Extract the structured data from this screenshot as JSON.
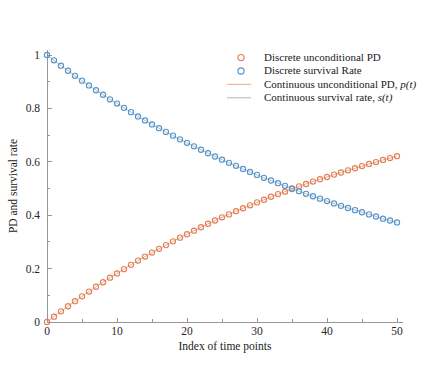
{
  "chart_data": {
    "type": "scatter",
    "title": "",
    "xlabel": "Index of time points",
    "ylabel": "PD and survival rate",
    "xlim": [
      0,
      50
    ],
    "ylim": [
      0,
      1
    ],
    "xticks": [
      0,
      10,
      20,
      30,
      40,
      50
    ],
    "xtick_labels": [
      "0",
      "10",
      "20",
      "30",
      "40",
      "50"
    ],
    "yticks": [
      0,
      0.2,
      0.4,
      0.6,
      0.8,
      1
    ],
    "ytick_labels": [
      "0",
      "0.2",
      "0.4",
      "0.6",
      "0.8",
      "1"
    ],
    "xminor_step": 5,
    "yminor_step": 0.1,
    "grid": false,
    "legend_position": "top-right",
    "marker": "open-circle",
    "colors": {
      "pd": "#E2815A",
      "survival": "#5596CE",
      "continuous_pd": "#E8A17F",
      "continuous_survival": "#6E7680",
      "axis": "#8C8C8C",
      "text": "#1A1A1A",
      "background": "#FFFFFF"
    },
    "x": [
      0,
      1,
      2,
      3,
      4,
      5,
      6,
      7,
      8,
      9,
      10,
      11,
      12,
      13,
      14,
      15,
      16,
      17,
      18,
      19,
      20,
      21,
      22,
      23,
      24,
      25,
      26,
      27,
      28,
      29,
      30,
      31,
      32,
      33,
      34,
      35,
      36,
      37,
      38,
      39,
      40,
      41,
      42,
      43,
      44,
      45,
      46,
      47,
      48,
      49,
      50
    ],
    "series": [
      {
        "name": "Discrete unconditional PD",
        "key": "pd",
        "style": "open-circle-marker",
        "color": "#E2815A",
        "values": [
          0.0,
          0.02,
          0.04,
          0.059,
          0.078,
          0.096,
          0.114,
          0.132,
          0.149,
          0.166,
          0.182,
          0.198,
          0.214,
          0.23,
          0.245,
          0.26,
          0.274,
          0.288,
          0.302,
          0.316,
          0.329,
          0.342,
          0.355,
          0.368,
          0.38,
          0.392,
          0.403,
          0.415,
          0.426,
          0.437,
          0.448,
          0.458,
          0.469,
          0.479,
          0.488,
          0.498,
          0.508,
          0.517,
          0.526,
          0.535,
          0.543,
          0.552,
          0.56,
          0.568,
          0.576,
          0.584,
          0.592,
          0.599,
          0.607,
          0.614,
          0.621
        ]
      },
      {
        "name": "Discrete survival Rate",
        "key": "survival",
        "style": "open-circle-marker",
        "color": "#5596CE",
        "values": [
          1.0,
          0.98,
          0.96,
          0.941,
          0.922,
          0.904,
          0.886,
          0.868,
          0.851,
          0.834,
          0.818,
          0.802,
          0.786,
          0.77,
          0.755,
          0.74,
          0.726,
          0.712,
          0.698,
          0.684,
          0.671,
          0.658,
          0.645,
          0.632,
          0.62,
          0.608,
          0.596,
          0.585,
          0.573,
          0.562,
          0.551,
          0.54,
          0.53,
          0.52,
          0.51,
          0.5,
          0.49,
          0.48,
          0.471,
          0.462,
          0.453,
          0.444,
          0.435,
          0.427,
          0.419,
          0.411,
          0.403,
          0.395,
          0.387,
          0.38,
          0.373
        ]
      },
      {
        "name": "Continuous unconditional PD, p(t)",
        "key": "continuous_pd",
        "style": "line",
        "color": "#E8A17F"
      },
      {
        "name": "Continuous survival rate, s(t)",
        "key": "continuous_survival",
        "style": "line",
        "color": "#6E7680"
      }
    ],
    "annotations": []
  },
  "legend": {
    "entries": [
      {
        "label": "Discrete unconditional PD",
        "marker": "open-circle",
        "color": "#E2815A"
      },
      {
        "label": "Discrete survival Rate",
        "marker": "open-circle",
        "color": "#5596CE"
      },
      {
        "label_plain": "Continuous unconditional PD, ",
        "label_italic": "p(t)",
        "marker": "line",
        "color": "#E8A17F"
      },
      {
        "label_plain": "Continuous survival rate, ",
        "label_italic": "s(t)",
        "marker": "line",
        "color": "#6E7680"
      }
    ]
  },
  "axes": {
    "x_title": "Index of time points",
    "y_title": "PD and survival rate"
  }
}
